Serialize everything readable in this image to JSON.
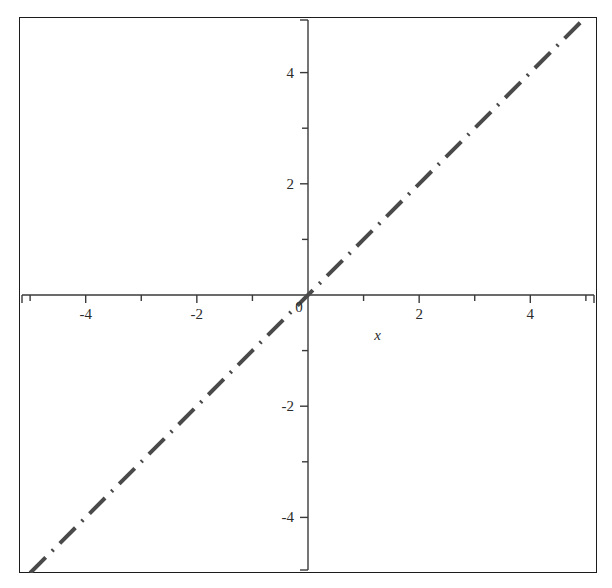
{
  "chart_data": {
    "type": "line",
    "title": "",
    "subtitle": "",
    "xlabel": "x",
    "ylabel": "",
    "xlim": [
      -5.2,
      5.2
    ],
    "ylim": [
      -5.0,
      5.0
    ],
    "grid": false,
    "legend": null,
    "legend_position": "none",
    "axes_style": "crossed-at-origin",
    "frame": true,
    "x_tick_labels": [
      "-4",
      "-2",
      "0",
      "2",
      "4"
    ],
    "x_tick_values": [
      -4,
      -2,
      0,
      2,
      4
    ],
    "x_minor_tick_values": [
      -5,
      -3,
      -1,
      1,
      3,
      5
    ],
    "y_tick_labels": [
      "-4",
      "-2",
      "0",
      "2",
      "4"
    ],
    "y_tick_values": [
      -4,
      -2,
      0,
      2,
      4
    ],
    "y_minor_tick_values": [
      -3,
      -1,
      1,
      3
    ],
    "origin_label": "0",
    "series": [
      {
        "name": "y = x",
        "color": "#4a4a4a",
        "linestyle": "dashdot",
        "linewidth": 4,
        "x": [
          -5.0,
          -4.0,
          -3.0,
          -2.0,
          -1.0,
          0.0,
          1.0,
          2.0,
          3.0,
          4.0,
          5.0
        ],
        "values": [
          -5.0,
          -4.0,
          -3.0,
          -2.0,
          -1.0,
          0.0,
          1.0,
          2.0,
          3.0,
          4.0,
          5.0
        ]
      }
    ],
    "colors": {
      "line": "#4a4a4a",
      "axis": "#3a3a3a",
      "frame": "#1c1c1c",
      "text": "#2b2b2b",
      "background": "#ffffff"
    }
  }
}
